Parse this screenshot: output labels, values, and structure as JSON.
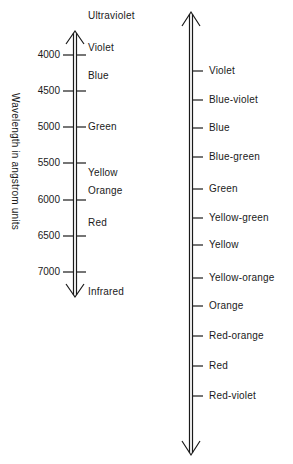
{
  "left_scale": {
    "axis_label": "Wavelength in angstrom units",
    "top_label": "Ultraviolet",
    "bottom_label": "Infrared",
    "ticks": [
      {
        "value": "4000",
        "y": 55
      },
      {
        "value": "4500",
        "y": 91
      },
      {
        "value": "5000",
        "y": 127
      },
      {
        "value": "5500",
        "y": 163
      },
      {
        "value": "6000",
        "y": 200
      },
      {
        "value": "6500",
        "y": 236
      },
      {
        "value": "7000",
        "y": 272
      }
    ],
    "colors": [
      {
        "name": "Violet",
        "y": 55
      },
      {
        "name": "Blue",
        "y": 76
      },
      {
        "name": "Green",
        "y": 127
      },
      {
        "name": "Yellow",
        "y": 172
      },
      {
        "name": "Orange",
        "y": 191
      },
      {
        "name": "Red",
        "y": 223
      }
    ]
  },
  "right_scale": {
    "colors": [
      {
        "name": "Violet",
        "y": 71
      },
      {
        "name": "Blue-violet",
        "y": 100
      },
      {
        "name": "Blue",
        "y": 128
      },
      {
        "name": "Blue-green",
        "y": 157
      },
      {
        "name": "Green",
        "y": 189
      },
      {
        "name": "Yellow-green",
        "y": 218
      },
      {
        "name": "Yellow",
        "y": 245
      },
      {
        "name": "Yellow-orange",
        "y": 278
      },
      {
        "name": "Orange",
        "y": 306
      },
      {
        "name": "Red-orange",
        "y": 336
      },
      {
        "name": "Red",
        "y": 366
      },
      {
        "name": "Red-violet",
        "y": 396
      }
    ]
  },
  "style": {
    "ink": "#1a1a1a",
    "background": "#ffffff"
  }
}
